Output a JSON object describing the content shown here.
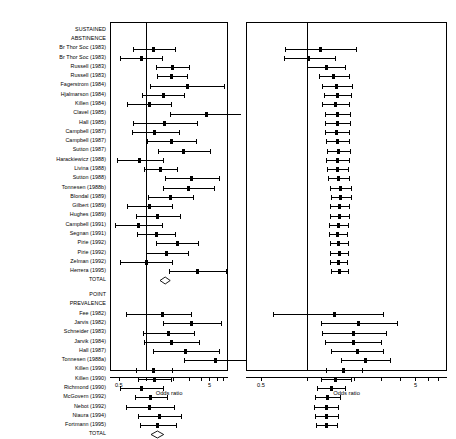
{
  "figure": {
    "axis_title": "Odds ratio",
    "tick_labels": [
      "0.5",
      "5"
    ],
    "total_label": "TOTAL",
    "section_headers": [
      {
        "line1": "SUSTAINED",
        "line2": "ABSTINENCE"
      },
      {
        "line1": "POINT",
        "line2": "PREVALENCE"
      }
    ],
    "scale": {
      "type": "log",
      "min": 0.4,
      "max": 8.0,
      "reference": 1
    }
  },
  "chart_data": {
    "type": "forest",
    "title": "",
    "xlabel": "Odds ratio",
    "ylabel": "",
    "xscale": "log",
    "xlim": [
      0.4,
      8.0
    ],
    "xticks": [
      0.5,
      1,
      2,
      3,
      4,
      5,
      6,
      7
    ],
    "xticklabels": [
      "0.5",
      "",
      "",
      "",
      "5",
      "",
      "",
      ""
    ],
    "reference_line": 1,
    "panels": [
      {
        "name": "individual-trials",
        "position": "left",
        "description": "Individual trial odds ratios with 95% confidence intervals"
      },
      {
        "name": "cumulative-meta-analysis",
        "position": "right",
        "description": "Cumulative meta-analysis pooled odds ratios with 95% confidence intervals"
      }
    ],
    "sections": [
      {
        "header": "SUSTAINED ABSTINENCE",
        "rows": [
          {
            "label": "Br Thor Soc (1983)",
            "or": 1.22,
            "lcl": 0.72,
            "ucl": 2.06,
            "cum_or": 1.22,
            "cum_lcl": 0.72,
            "cum_ucl": 2.06
          },
          {
            "label": "Br Thor Soc (1983)",
            "or": 0.88,
            "lcl": 0.52,
            "ucl": 1.48,
            "cum_or": 1.02,
            "cum_lcl": 0.7,
            "cum_ucl": 1.5
          },
          {
            "label": "Russell (1983)",
            "or": 1.95,
            "lcl": 1.3,
            "ucl": 2.95,
            "cum_or": 1.32,
            "cum_lcl": 1.0,
            "cum_ucl": 1.74
          },
          {
            "label": "Russell (1983)",
            "or": 1.92,
            "lcl": 1.32,
            "ucl": 2.82,
            "cum_or": 1.48,
            "cum_lcl": 1.18,
            "cum_ucl": 1.86
          },
          {
            "label": "Fagerstrom (1984)",
            "or": 2.85,
            "lcl": 1.1,
            "ucl": 7.2,
            "cum_or": 1.55,
            "cum_lcl": 1.25,
            "cum_ucl": 1.93
          },
          {
            "label": "Hjalmarson (1984)",
            "or": 1.55,
            "lcl": 0.9,
            "ucl": 2.65,
            "cum_or": 1.56,
            "cum_lcl": 1.27,
            "cum_ucl": 1.92
          },
          {
            "label": "Killen (1984)",
            "or": 1.08,
            "lcl": 0.62,
            "ucl": 1.88,
            "cum_or": 1.52,
            "cum_lcl": 1.25,
            "cum_ucl": 1.85
          },
          {
            "label": "Clavel (1985)",
            "or": 4.6,
            "lcl": 1.85,
            "ucl": 11.0,
            "cum_or": 1.56,
            "cum_lcl": 1.29,
            "cum_ucl": 1.89
          },
          {
            "label": "Hall (1985)",
            "or": 1.6,
            "lcl": 0.72,
            "ucl": 3.6,
            "cum_or": 1.57,
            "cum_lcl": 1.3,
            "cum_ucl": 1.89
          },
          {
            "label": "Campbell (1987)",
            "or": 1.25,
            "lcl": 0.7,
            "ucl": 2.3,
            "cum_or": 1.54,
            "cum_lcl": 1.29,
            "cum_ucl": 1.85
          },
          {
            "label": "Campbell (1987)",
            "or": 1.9,
            "lcl": 1.02,
            "ucl": 3.55,
            "cum_or": 1.56,
            "cum_lcl": 1.31,
            "cum_ucl": 1.86
          },
          {
            "label": "Sutton (1987)",
            "or": 2.6,
            "lcl": 1.35,
            "ucl": 5.1,
            "cum_or": 1.59,
            "cum_lcl": 1.34,
            "cum_ucl": 1.89
          },
          {
            "label": "Harackiewicz (1988)",
            "or": 0.85,
            "lcl": 0.48,
            "ucl": 1.52,
            "cum_or": 1.56,
            "cum_lcl": 1.32,
            "cum_ucl": 1.85
          },
          {
            "label": "Livina (1988)",
            "or": 1.45,
            "lcl": 0.95,
            "ucl": 2.2,
            "cum_or": 1.56,
            "cum_lcl": 1.33,
            "cum_ucl": 1.83
          },
          {
            "label": "Sutton (1988)",
            "or": 3.2,
            "lcl": 1.6,
            "ucl": 6.4,
            "cum_or": 1.59,
            "cum_lcl": 1.36,
            "cum_ucl": 1.86
          },
          {
            "label": "Tonnesen (1988b)",
            "or": 2.9,
            "lcl": 1.55,
            "ucl": 5.55,
            "cum_or": 1.63,
            "cum_lcl": 1.4,
            "cum_ucl": 1.9
          },
          {
            "label": "Blondal (1989)",
            "or": 1.85,
            "lcl": 1.05,
            "ucl": 3.3,
            "cum_or": 1.64,
            "cum_lcl": 1.42,
            "cum_ucl": 1.9
          },
          {
            "label": "Gilbert (1989)",
            "or": 1.1,
            "lcl": 0.62,
            "ucl": 1.95,
            "cum_or": 1.62,
            "cum_lcl": 1.4,
            "cum_ucl": 1.87
          },
          {
            "label": "Hughes (1989)",
            "or": 1.35,
            "lcl": 0.78,
            "ucl": 2.35,
            "cum_or": 1.61,
            "cum_lcl": 1.4,
            "cum_ucl": 1.85
          },
          {
            "label": "Campbell (1991)",
            "or": 0.82,
            "lcl": 0.45,
            "ucl": 1.5,
            "cum_or": 1.58,
            "cum_lcl": 1.38,
            "cum_ucl": 1.82
          },
          {
            "label": "Segnan (1991)",
            "or": 1.3,
            "lcl": 0.8,
            "ucl": 2.1,
            "cum_or": 1.57,
            "cum_lcl": 1.37,
            "cum_ucl": 1.8
          },
          {
            "label": "Pirie (1992)",
            "or": 2.2,
            "lcl": 1.3,
            "ucl": 3.7,
            "cum_or": 1.59,
            "cum_lcl": 1.39,
            "cum_ucl": 1.82
          },
          {
            "label": "Pirie (1992)",
            "or": 1.7,
            "lcl": 1.0,
            "ucl": 2.9,
            "cum_or": 1.6,
            "cum_lcl": 1.4,
            "cum_ucl": 1.82
          },
          {
            "label": "Zelman (1992)",
            "or": 1.0,
            "lcl": 0.52,
            "ucl": 1.92,
            "cum_or": 1.58,
            "cum_lcl": 1.39,
            "cum_ucl": 1.8
          },
          {
            "label": "Herrera (1995)",
            "or": 3.7,
            "lcl": 1.8,
            "ucl": 7.7,
            "cum_or": 1.62,
            "cum_lcl": 1.42,
            "cum_ucl": 1.84
          }
        ],
        "total": {
          "label": "TOTAL",
          "or": 1.62,
          "lcl": 1.42,
          "ucl": 1.84
        }
      },
      {
        "header": "POINT PREVALENCE",
        "rows": [
          {
            "label": "Fee (1982)",
            "or": 1.5,
            "lcl": 0.6,
            "ucl": 3.1,
            "cum_or": 1.5,
            "cum_lcl": 0.6,
            "cum_ucl": 3.1
          },
          {
            "label": "Jarvis (1982)",
            "or": 3.15,
            "lcl": 1.55,
            "ucl": 6.7,
            "cum_or": 2.15,
            "cum_lcl": 1.22,
            "cum_ucl": 3.8
          },
          {
            "label": "Schneider (1983)",
            "or": 1.75,
            "lcl": 0.92,
            "ucl": 3.35,
            "cum_or": 2.0,
            "cum_lcl": 1.25,
            "cum_ucl": 3.2
          },
          {
            "label": "Jarvik (1984)",
            "or": 1.92,
            "lcl": 0.95,
            "ucl": 3.85,
            "cum_or": 1.98,
            "cum_lcl": 1.3,
            "cum_ucl": 3.0
          },
          {
            "label": "Hall (1987)",
            "or": 2.7,
            "lcl": 1.2,
            "ucl": 6.3,
            "cum_or": 2.1,
            "cum_lcl": 1.42,
            "cum_ucl": 3.1
          },
          {
            "label": "Tonnesen (1988a)",
            "or": 5.8,
            "lcl": 2.6,
            "ucl": 13.5,
            "cum_or": 2.38,
            "cum_lcl": 1.65,
            "cum_ucl": 3.42
          },
          {
            "label": "Killen (1990)",
            "or": 1.22,
            "lcl": 0.78,
            "ucl": 1.92,
            "cum_or": 1.72,
            "cum_lcl": 1.32,
            "cum_ucl": 2.25
          },
          {
            "label": "Killen (1990)",
            "or": 1.25,
            "lcl": 0.82,
            "ucl": 1.9,
            "cum_or": 1.52,
            "cum_lcl": 1.22,
            "cum_ucl": 1.9
          },
          {
            "label": "Richmond (1990)",
            "or": 0.88,
            "lcl": 0.52,
            "ucl": 1.52,
            "cum_or": 1.42,
            "cum_lcl": 1.16,
            "cum_ucl": 1.74
          },
          {
            "label": "McGovern (1992)",
            "or": 1.12,
            "lcl": 0.75,
            "ucl": 1.68,
            "cum_or": 1.35,
            "cum_lcl": 1.12,
            "cum_ucl": 1.62
          },
          {
            "label": "Nebot (1992)",
            "or": 1.1,
            "lcl": 0.6,
            "ucl": 2.05,
            "cum_or": 1.32,
            "cum_lcl": 1.11,
            "cum_ucl": 1.57
          },
          {
            "label": "Niaura (1994)",
            "or": 1.4,
            "lcl": 0.82,
            "ucl": 2.4,
            "cum_or": 1.33,
            "cum_lcl": 1.12,
            "cum_ucl": 1.57
          },
          {
            "label": "Fortmann (1995)",
            "or": 1.35,
            "lcl": 0.85,
            "ucl": 2.15,
            "cum_or": 1.33,
            "cum_lcl": 1.13,
            "cum_ucl": 1.56
          }
        ],
        "total": {
          "label": "TOTAL",
          "or": 1.33,
          "lcl": 1.13,
          "ucl": 1.56
        }
      }
    ]
  }
}
